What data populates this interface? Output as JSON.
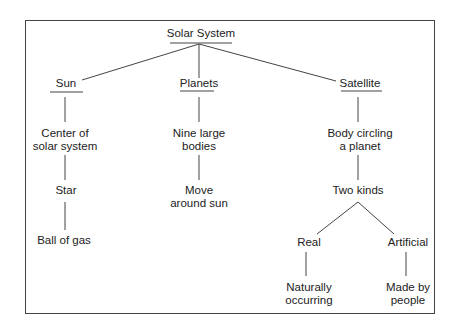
{
  "diagram": {
    "title": "Solar System",
    "branches": [
      {
        "label": "Sun",
        "chain": [
          "Center of\nsolar system",
          "Star",
          "Ball of gas"
        ]
      },
      {
        "label": "Planets",
        "chain": [
          "Nine large\nbodies",
          "Move\naround sun"
        ]
      },
      {
        "label": "Satellite",
        "chain": [
          "Body circling\na planet",
          "Two kinds"
        ],
        "split": [
          {
            "label": "Real",
            "detail": "Naturally\noccurring"
          },
          {
            "label": "Artificial",
            "detail": "Made by\npeople"
          }
        ]
      }
    ]
  },
  "nodes": {
    "root": "Solar System",
    "sun": "Sun",
    "sun_1a": "Center of",
    "sun_1b": "solar system",
    "sun_2": "Star",
    "sun_3": "Ball of gas",
    "planets": "Planets",
    "planets_1a": "Nine large",
    "planets_1b": "bodies",
    "planets_2a": "Move",
    "planets_2b": "around sun",
    "satellite": "Satellite",
    "satellite_1a": "Body circling",
    "satellite_1b": "a planet",
    "satellite_2": "Two kinds",
    "real": "Real",
    "real_1a": "Naturally",
    "real_1b": "occurring",
    "artificial": "Artificial",
    "artificial_1a": "Made by",
    "artificial_1b": "people"
  },
  "colors": {
    "line": "#444444",
    "text": "#222222",
    "background": "#ffffff"
  }
}
